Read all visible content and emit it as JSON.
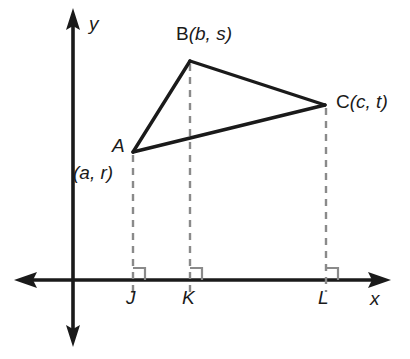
{
  "figure": {
    "axes": {
      "x_label": "x",
      "y_label": "y",
      "x_axis_y": 280,
      "y_axis_x": 73,
      "x_axis_left_end": 15,
      "x_axis_right_end": 390,
      "y_axis_top_end": 10,
      "y_axis_bottom_end": 345,
      "axis_color": "#1a1a1a",
      "axis_width": 3.5
    },
    "triangle": {
      "stroke_color": "#1a1a1a",
      "stroke_width": 3.4,
      "vertices": [
        {
          "name": "A",
          "label": "A",
          "coord_label": "(a, r)",
          "x": 133,
          "y": 152
        },
        {
          "name": "B",
          "label": "B",
          "coord_label": "(b, s)",
          "x": 190,
          "y": 61
        },
        {
          "name": "C",
          "label": "C",
          "coord_label": "(c, t)",
          "x": 325,
          "y": 105
        }
      ]
    },
    "drop_lines": {
      "color": "#8a8a8a",
      "width": 2.4,
      "dash": "7,6",
      "items": [
        {
          "from_vertex": "A",
          "foot_label": "J",
          "x": 133,
          "top": 152
        },
        {
          "from_vertex": "B",
          "foot_label": "K",
          "x": 190,
          "top": 61
        },
        {
          "from_vertex": "C",
          "foot_label": "L",
          "x": 326,
          "top": 105
        }
      ]
    },
    "right_angle_marks": {
      "color": "#8a8a8a",
      "size": 11,
      "at": [
        "J",
        "K",
        "L"
      ]
    },
    "labels": {
      "vertex_a": "A",
      "coord_a": "(a, r)",
      "vertex_b_name": "B",
      "vertex_b_coords": "(b, s)",
      "vertex_c_name": "C",
      "vertex_c_coords": "(c, t)",
      "foot_j": "J",
      "foot_k": "K",
      "foot_l": "L",
      "axis_x": "x",
      "axis_y": "y"
    }
  }
}
